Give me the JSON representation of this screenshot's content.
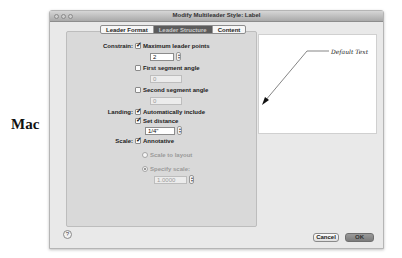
{
  "side_label": "Mac",
  "window": {
    "title": "Modify Multileader Style: Label",
    "traffic_lights": [
      "close",
      "minimize",
      "zoom"
    ]
  },
  "tabs": [
    {
      "label": "Leader Format",
      "active": false
    },
    {
      "label": "Leader Structure",
      "active": true
    },
    {
      "label": "Content",
      "active": false
    }
  ],
  "constrain": {
    "label": "Constrain:",
    "max_leader_points": {
      "label": "Maximum leader points",
      "checked": true,
      "value": "2"
    },
    "first_segment_angle": {
      "label": "First segment angle",
      "checked": false,
      "value": "0"
    },
    "second_segment_angle": {
      "label": "Second segment angle",
      "checked": false,
      "value": "0"
    }
  },
  "landing": {
    "label": "Landing:",
    "automatically_include": {
      "label": "Automatically include",
      "checked": true
    },
    "set_distance": {
      "label": "Set distance",
      "checked": true,
      "value": "1/4\""
    }
  },
  "scale": {
    "label": "Scale:",
    "annotative": {
      "label": "Annotative",
      "checked": true
    },
    "scale_to_layout": {
      "label": "Scale to layout",
      "selected": false
    },
    "specify_scale": {
      "label": "Specify scale:",
      "selected": true,
      "value": "1.0000"
    }
  },
  "preview": {
    "text": "Default Text"
  },
  "footer": {
    "help_label": "?",
    "cancel_label": "Cancel",
    "ok_label": "OK"
  }
}
